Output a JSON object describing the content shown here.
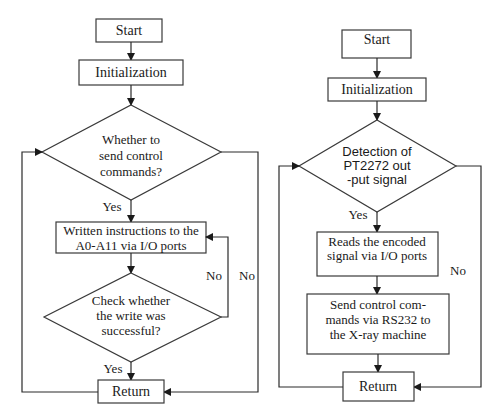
{
  "left_flowchart": {
    "start": "Start",
    "init": "Initialization",
    "decision1": [
      "Whether to",
      "send control",
      "commands?"
    ],
    "decision1_yes": "Yes",
    "process": [
      "Written instructions to the",
      "A0-A11 via I/O ports"
    ],
    "decision2": [
      "Check whether",
      "the write was",
      "successful?"
    ],
    "decision2_yes": "Yes",
    "decision2_no": "No",
    "decision1_no": "No",
    "return": "Return"
  },
  "right_flowchart": {
    "start": "Start",
    "init": "Initialization",
    "decision": [
      "Detection of",
      "PT2272 out",
      "-put signal"
    ],
    "decision_yes": "Yes",
    "decision_no": "No",
    "process1": [
      "Reads the encoded",
      "signal via I/O ports"
    ],
    "process2": [
      "Send control com-",
      "mands via RS232 to",
      "the X-ray machine"
    ],
    "return": "Return"
  }
}
